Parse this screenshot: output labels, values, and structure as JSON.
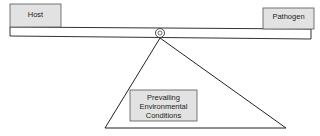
{
  "diagram": {
    "type": "balance-scale",
    "left_weight": {
      "label": "Host"
    },
    "right_weight": {
      "label": "Pathogen"
    },
    "fulcrum": {
      "lines": [
        "Prevailing",
        "Environmental",
        "Conditions"
      ]
    },
    "colors": {
      "box_fill": "#e2e2e2",
      "stroke": "#333333",
      "background": "#ffffff"
    }
  }
}
